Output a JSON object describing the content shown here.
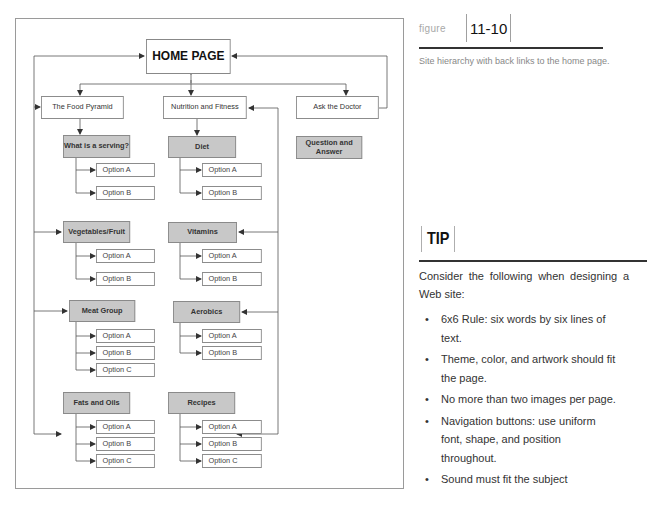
{
  "figure": {
    "label": "figure",
    "number": "11-10",
    "caption": "Site hierarchy with back links to the home page."
  },
  "diagram": {
    "home": "HOME PAGE",
    "sections": [
      {
        "label": "The Food Pyramid",
        "subpages": [
          {
            "label": "What is a serving?",
            "options": [
              "Option A",
              "Option B"
            ]
          },
          {
            "label": "Vegetables/Fruit",
            "options": [
              "Option A",
              "Option B"
            ]
          },
          {
            "label": "Meat Group",
            "options": [
              "Option A",
              "Option B",
              "Option C"
            ]
          },
          {
            "label": "Fats and Oils",
            "options": [
              "Option A",
              "Option B",
              "Option C"
            ]
          }
        ]
      },
      {
        "label": "Nutrition and Fitness",
        "subpages": [
          {
            "label": "Diet",
            "options": [
              "Option A",
              "Option B"
            ]
          },
          {
            "label": "Vitamins",
            "options": [
              "Option A",
              "Option B"
            ]
          },
          {
            "label": "Aerobics",
            "options": [
              "Option A",
              "Option B"
            ]
          },
          {
            "label": "Recipes",
            "options": [
              "Option A",
              "Option B",
              "Option C"
            ]
          }
        ]
      },
      {
        "label": "Ask the Doctor",
        "subpages": [
          {
            "label": "Question and Answer",
            "options": []
          }
        ]
      }
    ]
  },
  "tip": {
    "title": "TIP",
    "intro": "Consider the following when designing a Web site:",
    "bullet_glyph": "•",
    "items": [
      "6x6 Rule: six words by six lines of text.",
      "Theme, color, and artwork should fit the page.",
      "No more than two images per page.",
      "Navigation buttons: use uniform font, shape, and position throughout.",
      "Sound must fit the subject"
    ]
  },
  "colors": {
    "subpage_fill": "#c8c8c8",
    "line": "#555555",
    "frame": "#9a9a9a",
    "caption_text": "#888888"
  }
}
